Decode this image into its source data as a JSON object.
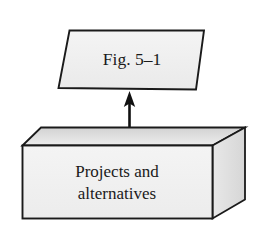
{
  "diagram": {
    "nodes": {
      "fig_label": {
        "text": "Fig. 5–1",
        "shape": "parallelogram",
        "fill_color": "#f1f1f1",
        "stroke_color": "#1a1a1a"
      },
      "base_box": {
        "line1": "Projects and",
        "line2": "alternatives",
        "shape": "3d-box",
        "front_fill_color": "#f2f2f2",
        "top_fill_color": "#dcdcdc",
        "side_fill_color": "#e4e4e4",
        "stroke_color": "#1a1a1a"
      }
    },
    "connector": {
      "type": "arrow",
      "direction": "up",
      "from": "base_box",
      "to": "fig_label",
      "color": "#111111"
    },
    "background_color": "#ffffff"
  }
}
